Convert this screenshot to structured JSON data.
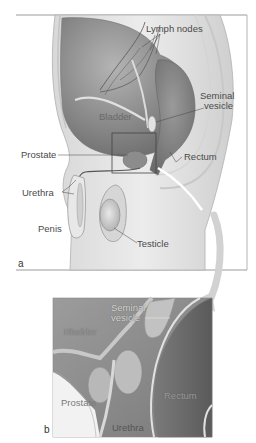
{
  "figure": {
    "panel_a": {
      "letter": "a",
      "labels": {
        "lymph_nodes": "Lymph nodes",
        "seminal_vesicle_1": "Seminal",
        "seminal_vesicle_2": "vesicle",
        "bladder": "Bladder",
        "prostate": "Prostate",
        "rectum": "Rectum",
        "urethra": "Urethra",
        "penis": "Penis",
        "testicle": "Testicle"
      }
    },
    "panel_b": {
      "letter": "b",
      "labels": {
        "seminal_vesicle_1": "Seminal",
        "seminal_vesicle_2": "vesicle",
        "bladder": "Bladder",
        "prostate": "Prostate",
        "rectum": "Rectum",
        "urethra": "Urethra"
      }
    },
    "colors": {
      "background": "#ffffff",
      "frame": "#9a9a9a",
      "body_light": "#e6e6e6",
      "organ_dark": "#8a8a8a",
      "organ_mid": "#a8a8a8",
      "label_text": "#4a4a4a",
      "arrow": "#d0d0d0"
    }
  }
}
